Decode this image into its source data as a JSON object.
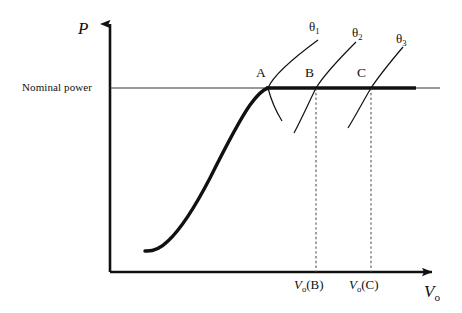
{
  "figure": {
    "type": "diagram",
    "background_color": "#ffffff",
    "ink_color": "#111111"
  },
  "axes": {
    "y_label": "P",
    "x_label_base": "V",
    "x_label_sub": "o",
    "origin": {
      "x": 110,
      "y": 272
    },
    "y_top": {
      "x": 110,
      "y": 18
    },
    "x_right": {
      "x": 440,
      "y": 272
    }
  },
  "nominal_power": {
    "label": "Nominal power",
    "level_y": 88,
    "thin_line": {
      "x_start": 110,
      "x_end": 440
    },
    "thick_line": {
      "x_start": 268,
      "x_end": 416
    }
  },
  "power_curve": {
    "name": "power-curve",
    "start": {
      "x": 145,
      "y": 251
    },
    "knee": {
      "x": 268,
      "y": 88
    },
    "stroke_width": 3.2
  },
  "operating_points": [
    {
      "label": "A",
      "x": 268,
      "y": 88,
      "label_x": 256,
      "label_y": 68
    },
    {
      "label": "B",
      "x": 316,
      "y": 88,
      "label_x": 305,
      "label_y": 68
    },
    {
      "label": "C",
      "x": 371,
      "y": 88,
      "label_x": 357,
      "label_y": 68
    }
  ],
  "pitch_lines": [
    {
      "label_base": "θ",
      "label_sub": "1",
      "label_x": 309,
      "label_y": 22,
      "path": "M 268,88 C 280,76 296,62 318,40",
      "tail": "M 268,88 L 282,120"
    },
    {
      "label_base": "θ",
      "label_sub": "2",
      "label_x": 352,
      "label_y": 28,
      "path": "M 316,88 C 326,76 340,60 356,42",
      "tail": "M 316,88 L 294,132"
    },
    {
      "label_base": "θ",
      "label_sub": "3",
      "label_x": 396,
      "label_y": 33,
      "path": "M 371,88 C 379,78 390,62 402,48",
      "tail": "M 371,88 L 348,128"
    }
  ],
  "dashed_drops": [
    {
      "x": 316,
      "y_top": 88,
      "y_bottom": 272
    },
    {
      "x": 371,
      "y_top": 88,
      "y_bottom": 272
    }
  ],
  "x_ticks": [
    {
      "base": "V",
      "sub": "o",
      "suffix": "(B)",
      "x": 298,
      "y": 280
    },
    {
      "base": "V",
      "sub": "o",
      "suffix": "(C)",
      "x": 352,
      "y": 280
    }
  ]
}
